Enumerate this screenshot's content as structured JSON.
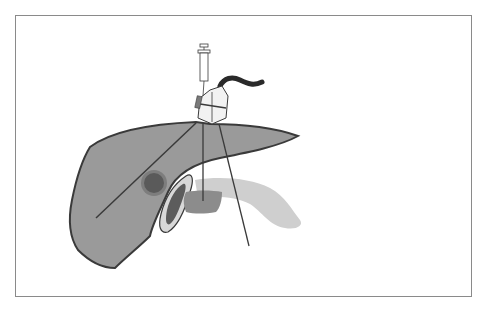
{
  "figure": {
    "colors": {
      "frame": "#8a8a8a",
      "liver_fill": "#9a9a9a",
      "liver_outline": "#3a3a3a",
      "lesion_outer": "#7d7d7d",
      "lesion_inner": "#5a5a5a",
      "gallbladder_wall": "#d8d8d8",
      "gallbladder_inner": "#5c5c5c",
      "portal_region": "#8c8c8c",
      "pancreas": "#cfcfcf",
      "probe_cable": "#2a2a2a",
      "lines": "#3a3a3a"
    },
    "elements": [
      "syringe",
      "ultrasound-probe",
      "probe-cable",
      "needle-guide",
      "liver",
      "lesion",
      "gallbladder",
      "portal-region",
      "pancreas",
      "needle-path",
      "beam-lines"
    ]
  }
}
